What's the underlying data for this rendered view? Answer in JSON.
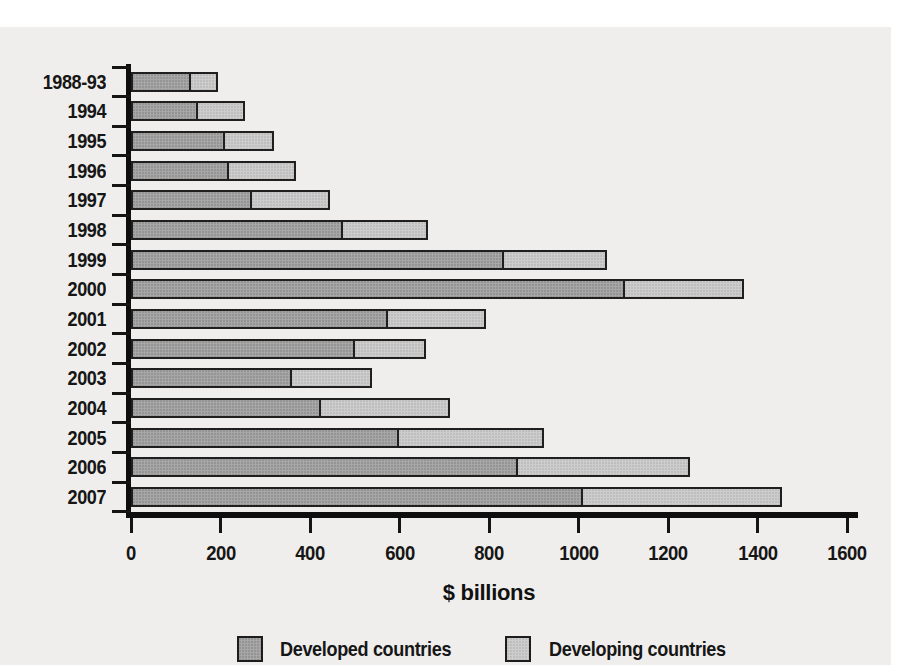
{
  "chart_data": {
    "type": "bar",
    "orientation": "horizontal",
    "stacked": true,
    "xlabel": "$ billions",
    "xlim": [
      0,
      1600
    ],
    "xticks": [
      0,
      200,
      400,
      600,
      800,
      1000,
      1200,
      1400,
      1600
    ],
    "grid": false,
    "legend_position": "bottom",
    "categories": [
      "1988-93",
      "1994",
      "1995",
      "1996",
      "1997",
      "1998",
      "1999",
      "2000",
      "2001",
      "2002",
      "2003",
      "2004",
      "2005",
      "2006",
      "2007"
    ],
    "series": [
      {
        "name": "Developed countries",
        "color": "#a7a7a7",
        "values": [
          130,
          145,
          205,
          215,
          265,
          470,
          830,
          1100,
          570,
          495,
          355,
          420,
          595,
          860,
          1005
        ]
      },
      {
        "name": "Developing countries",
        "color": "#cdcdcd",
        "values": [
          55,
          100,
          105,
          145,
          170,
          185,
          225,
          260,
          215,
          155,
          175,
          285,
          320,
          380,
          440
        ]
      }
    ],
    "totals": [
      185,
      245,
      310,
      360,
      435,
      655,
      1055,
      1360,
      785,
      650,
      530,
      705,
      915,
      1240,
      1445
    ]
  },
  "colors": {
    "paper_background": "#efeeec",
    "page_background": "#ffffff",
    "axis": "#0e0e0e",
    "bar_border": "#1f1f1f",
    "text": "#161616"
  }
}
